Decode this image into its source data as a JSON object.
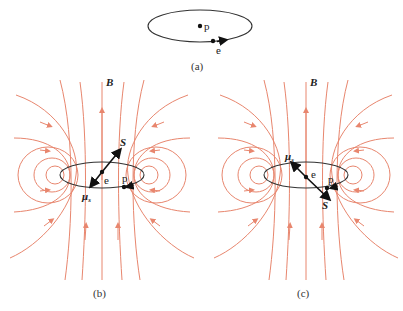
{
  "figure": {
    "panels": [
      {
        "id": "a",
        "caption": "(a)",
        "labels": {
          "proton": "p",
          "electron": "e"
        }
      },
      {
        "id": "b",
        "caption": "(b)",
        "labels": {
          "field": "B",
          "spin": "S",
          "moment": "μ",
          "moment_sub": "s",
          "electron": "e",
          "proton": "p"
        }
      },
      {
        "id": "c",
        "caption": "(c)",
        "labels": {
          "field": "B",
          "spin": "S",
          "moment": "μ",
          "moment_sub": "s",
          "electron": "e",
          "proton": "p"
        }
      }
    ],
    "colors": {
      "field_lines": "#e8866e",
      "orbit": "#333333",
      "text": "#222222"
    }
  }
}
